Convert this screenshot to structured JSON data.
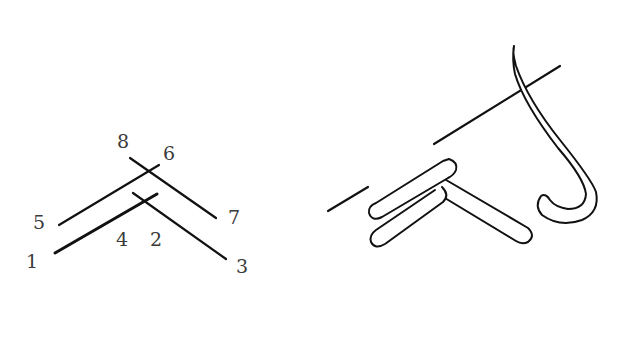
{
  "diagram": {
    "stroke_color": "#111111",
    "label_color": "#3a3a3a",
    "left_figure": {
      "description": "Numbered stitch sequence",
      "labels": [
        {
          "id": "l1",
          "text": "1",
          "x": 26,
          "y": 252
        },
        {
          "id": "l2",
          "text": "2",
          "x": 150,
          "y": 230
        },
        {
          "id": "l3",
          "text": "3",
          "x": 236,
          "y": 257
        },
        {
          "id": "l4",
          "text": "4",
          "x": 116,
          "y": 230
        },
        {
          "id": "l5",
          "text": "5",
          "x": 33,
          "y": 213
        },
        {
          "id": "l6",
          "text": "6",
          "x": 163,
          "y": 144
        },
        {
          "id": "l7",
          "text": "7",
          "x": 228,
          "y": 208
        },
        {
          "id": "l8",
          "text": "8",
          "x": 117,
          "y": 132
        }
      ]
    },
    "right_figure": {
      "description": "Needle passing under worked stitches"
    }
  }
}
